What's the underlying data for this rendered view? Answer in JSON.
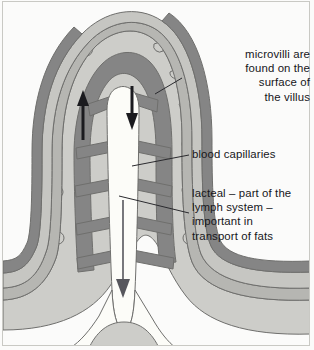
{
  "figure": {
    "background_color": "#fbfbfa",
    "frame_color": "#c9c9c4"
  },
  "labels": {
    "microvilli": "microvilli are\nfound on the\nsurface of\nthe villus",
    "blood_capillaries": "blood capillaries",
    "lacteal": "lacteal – part of the\nlymph system –\nimportant in\ntransport of fats"
  },
  "diagram": {
    "layers": [
      {
        "name": "epithelium-outer",
        "color": "#cdcdc9"
      },
      {
        "name": "epithelium-inner",
        "color": "#b6b6b2"
      },
      {
        "name": "connective-tissue",
        "color": "#c6c6c2"
      },
      {
        "name": "capillary-vessel",
        "color": "#858585"
      },
      {
        "name": "lacteal-lumen",
        "color": "#fcfcf8"
      }
    ],
    "outline_color": "#6f6f6d",
    "arrow_color": "#1b1b1f",
    "leader_color": "#2a2a2e",
    "arrows": [
      {
        "name": "capillary-flow-up",
        "direction": "up"
      },
      {
        "name": "capillary-flow-down",
        "direction": "down"
      },
      {
        "name": "lacteal-flow-down",
        "direction": "down"
      }
    ],
    "microvilli_bump_count": 12
  }
}
